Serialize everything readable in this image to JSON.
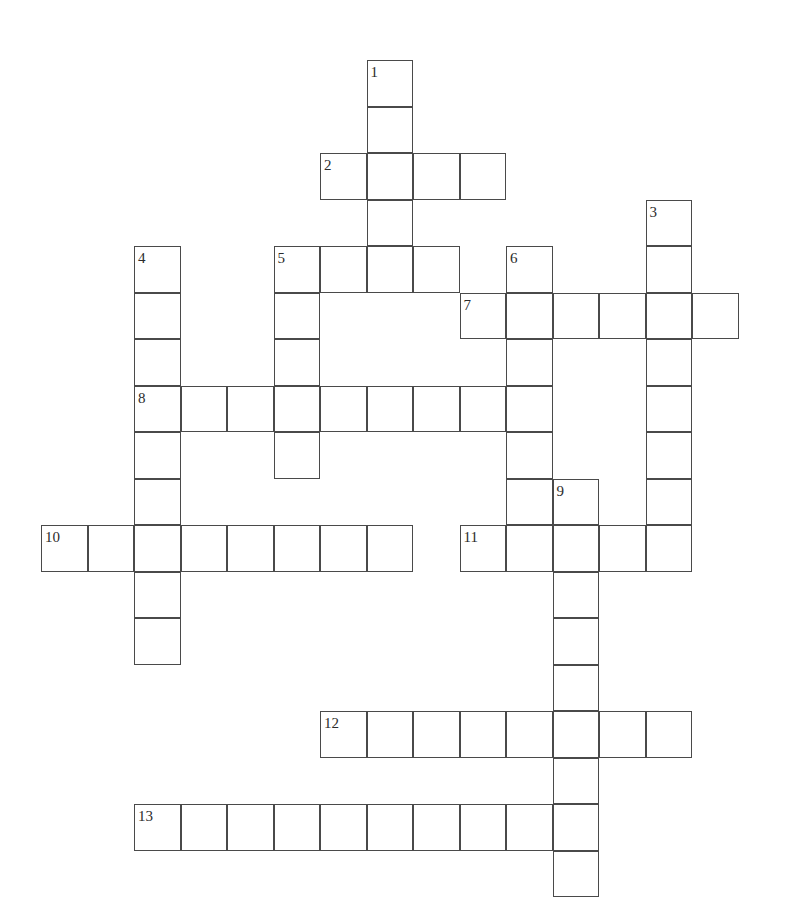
{
  "puzzle": {
    "title": "Crossword Grid",
    "type": "crossword",
    "background_color": "#ffffff",
    "cell_fill_color": "#ffffff",
    "cell_border_color": "#4a4a4a",
    "number_color": "#2b2b2b",
    "cell_size_px": 46.5,
    "origin_x_px": 41,
    "origin_y_px": 60,
    "columns": 14,
    "rows": 18,
    "total_cells": 100,
    "entry_count": 13
  },
  "grid": {
    "cells": [
      {
        "col": 7,
        "row": 0
      },
      {
        "col": 7,
        "row": 1
      },
      {
        "col": 6,
        "row": 2
      },
      {
        "col": 7,
        "row": 2
      },
      {
        "col": 8,
        "row": 2
      },
      {
        "col": 9,
        "row": 2
      },
      {
        "col": 7,
        "row": 3
      },
      {
        "col": 13,
        "row": 3
      },
      {
        "col": 2,
        "row": 4
      },
      {
        "col": 5,
        "row": 4
      },
      {
        "col": 6,
        "row": 4
      },
      {
        "col": 7,
        "row": 4
      },
      {
        "col": 8,
        "row": 4
      },
      {
        "col": 10,
        "row": 4
      },
      {
        "col": 13,
        "row": 4
      },
      {
        "col": 2,
        "row": 5
      },
      {
        "col": 5,
        "row": 5
      },
      {
        "col": 9,
        "row": 5
      },
      {
        "col": 10,
        "row": 5
      },
      {
        "col": 11,
        "row": 5
      },
      {
        "col": 12,
        "row": 5
      },
      {
        "col": 13,
        "row": 5
      },
      {
        "col": 14,
        "row": 5
      },
      {
        "col": 2,
        "row": 6
      },
      {
        "col": 5,
        "row": 6
      },
      {
        "col": 10,
        "row": 6
      },
      {
        "col": 13,
        "row": 6
      },
      {
        "col": 2,
        "row": 7
      },
      {
        "col": 3,
        "row": 7
      },
      {
        "col": 4,
        "row": 7
      },
      {
        "col": 5,
        "row": 7
      },
      {
        "col": 6,
        "row": 7
      },
      {
        "col": 7,
        "row": 7
      },
      {
        "col": 8,
        "row": 7
      },
      {
        "col": 9,
        "row": 7
      },
      {
        "col": 10,
        "row": 7
      },
      {
        "col": 13,
        "row": 7
      },
      {
        "col": 2,
        "row": 8
      },
      {
        "col": 5,
        "row": 8
      },
      {
        "col": 10,
        "row": 8
      },
      {
        "col": 13,
        "row": 8
      },
      {
        "col": 2,
        "row": 9
      },
      {
        "col": 10,
        "row": 9
      },
      {
        "col": 11,
        "row": 9
      },
      {
        "col": 13,
        "row": 9
      },
      {
        "col": 0,
        "row": 10
      },
      {
        "col": 1,
        "row": 10
      },
      {
        "col": 2,
        "row": 10
      },
      {
        "col": 3,
        "row": 10
      },
      {
        "col": 4,
        "row": 10
      },
      {
        "col": 5,
        "row": 10
      },
      {
        "col": 6,
        "row": 10
      },
      {
        "col": 7,
        "row": 10
      },
      {
        "col": 9,
        "row": 10
      },
      {
        "col": 10,
        "row": 10
      },
      {
        "col": 11,
        "row": 10
      },
      {
        "col": 12,
        "row": 10
      },
      {
        "col": 13,
        "row": 10
      },
      {
        "col": 2,
        "row": 11
      },
      {
        "col": 11,
        "row": 11
      },
      {
        "col": 2,
        "row": 12
      },
      {
        "col": 11,
        "row": 12
      },
      {
        "col": 11,
        "row": 13
      },
      {
        "col": 6,
        "row": 14
      },
      {
        "col": 7,
        "row": 14
      },
      {
        "col": 8,
        "row": 14
      },
      {
        "col": 9,
        "row": 14
      },
      {
        "col": 10,
        "row": 14
      },
      {
        "col": 11,
        "row": 14
      },
      {
        "col": 12,
        "row": 14
      },
      {
        "col": 13,
        "row": 14
      },
      {
        "col": 11,
        "row": 15
      },
      {
        "col": 2,
        "row": 16
      },
      {
        "col": 3,
        "row": 16
      },
      {
        "col": 4,
        "row": 16
      },
      {
        "col": 5,
        "row": 16
      },
      {
        "col": 6,
        "row": 16
      },
      {
        "col": 7,
        "row": 16
      },
      {
        "col": 8,
        "row": 16
      },
      {
        "col": 9,
        "row": 16
      },
      {
        "col": 10,
        "row": 16
      },
      {
        "col": 11,
        "row": 16
      },
      {
        "col": 11,
        "row": 17
      }
    ]
  },
  "numbers": [
    {
      "label": "1",
      "col": 7,
      "row": 0,
      "direction": "down",
      "length": 5
    },
    {
      "label": "2",
      "col": 6,
      "row": 2,
      "direction": "across",
      "length": 4
    },
    {
      "label": "3",
      "col": 13,
      "row": 3,
      "direction": "down",
      "length": 8
    },
    {
      "label": "4",
      "col": 2,
      "row": 4,
      "direction": "down",
      "length": 9
    },
    {
      "label": "5",
      "col": 5,
      "row": 4,
      "direction": "both",
      "length": 4
    },
    {
      "label": "6",
      "col": 10,
      "row": 4,
      "direction": "down",
      "length": 6
    },
    {
      "label": "7",
      "col": 9,
      "row": 5,
      "direction": "across",
      "length": 6
    },
    {
      "label": "8",
      "col": 2,
      "row": 7,
      "direction": "across",
      "length": 9
    },
    {
      "label": "9",
      "col": 11,
      "row": 9,
      "direction": "down",
      "length": 9
    },
    {
      "label": "10",
      "col": 0,
      "row": 10,
      "direction": "across",
      "length": 8
    },
    {
      "label": "11",
      "col": 9,
      "row": 10,
      "direction": "across",
      "length": 5
    },
    {
      "label": "12",
      "col": 6,
      "row": 14,
      "direction": "across",
      "length": 8
    },
    {
      "label": "13",
      "col": 2,
      "row": 16,
      "direction": "across",
      "length": 10
    }
  ]
}
